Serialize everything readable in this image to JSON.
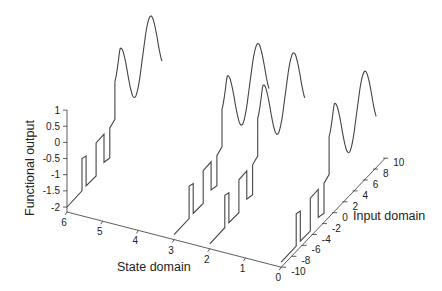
{
  "chart_data": {
    "type": "line",
    "projection": "3d-waterfall",
    "title": "",
    "xlabel": "Input domain",
    "ylabel": "State domain",
    "zlabel": "Functional output",
    "x_ticks": [
      -10,
      -8,
      -6,
      -4,
      -2,
      0,
      2,
      4,
      6,
      8,
      10
    ],
    "y_ticks": [
      6,
      5,
      4,
      3,
      2,
      1,
      0
    ],
    "z_ticks": [
      1,
      0.5,
      0,
      -0.5,
      -1,
      -1.5,
      -2
    ],
    "xlim": [
      -10,
      10
    ],
    "ylim": [
      0,
      6
    ],
    "zlim": [
      -2,
      1
    ],
    "grid": false,
    "legend": null,
    "series": [
      {
        "name": "state 6",
        "state": 6
      },
      {
        "name": "state 3",
        "state": 3
      },
      {
        "name": "state 2",
        "state": 2
      },
      {
        "name": "state 0",
        "state": 0
      }
    ],
    "profile": {
      "description": "Each series shares this shape: flat at -2, a square-wave step segment, then an oscillation of growing amplitude",
      "points": [
        [
          -10,
          -2
        ],
        [
          -7.05,
          -2
        ],
        [
          -7.05,
          -1.0
        ],
        [
          -6.25,
          -1.05
        ],
        [
          -6.25,
          -1.98
        ],
        [
          -4.3,
          -2.0
        ],
        [
          -4.3,
          -0.98
        ],
        [
          -2.75,
          -0.97
        ],
        [
          -2.75,
          -1.84
        ],
        [
          -1.6,
          -1.9
        ],
        [
          -1.6,
          -0.97
        ],
        [
          -0.6,
          -0.87
        ],
        [
          -0.6,
          0.3
        ]
      ],
      "oscillation": {
        "x_start": -0.6,
        "x_end": 8.6,
        "offset": 0.15,
        "amplitude": 1.0,
        "period": 5.9,
        "first_peak_x": 0.4
      }
    }
  },
  "axes": {
    "z_title": "Functional output",
    "state_title": "State domain",
    "input_title": "Input domain"
  }
}
